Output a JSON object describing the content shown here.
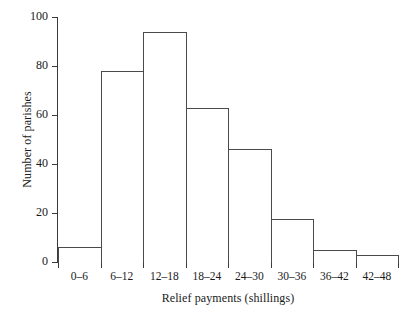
{
  "chart_data": {
    "type": "bar",
    "title": "",
    "subtitle": "",
    "xlabel": "Relief payments (shillings)",
    "ylabel": "Number of parishes",
    "categories": [
      "0–6",
      "6–12",
      "12–18",
      "18–24",
      "24–30",
      "30–36",
      "36–42",
      "42–48"
    ],
    "values": [
      6,
      78,
      94,
      63,
      46,
      17.5,
      5,
      3
    ],
    "ylim": [
      0,
      100
    ],
    "yticks": [
      0,
      20,
      40,
      60,
      80,
      100
    ],
    "ytick_labels": [
      "0",
      "20",
      "40",
      "60",
      "80",
      "100"
    ],
    "grid": false,
    "legend": false,
    "legend_position": "none",
    "bar_fill": "#ffffff",
    "bar_edge": "#4a4a4a",
    "axis_color": "#3a3a3a",
    "background": "#ffffff"
  }
}
